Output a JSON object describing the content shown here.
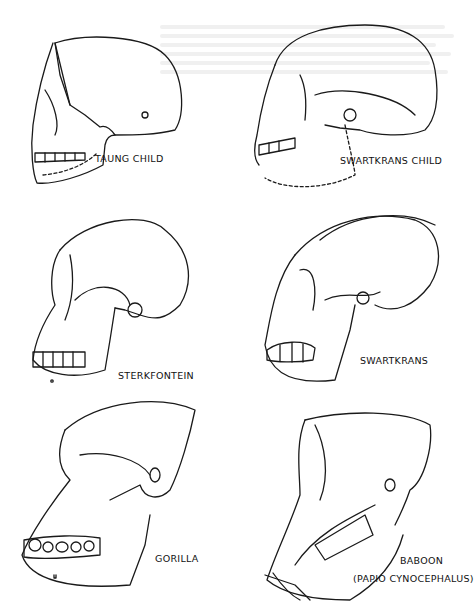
{
  "figures": [
    {
      "id": "taung-child",
      "caption": "TAUNG CHILD"
    },
    {
      "id": "swartkrans-child",
      "caption": "SWARTKRANS CHILD"
    },
    {
      "id": "sterkfontein",
      "caption": "STERKFONTEIN"
    },
    {
      "id": "swartkrans",
      "caption": "SWARTKRANS"
    },
    {
      "id": "gorilla",
      "caption": "GORILLA"
    },
    {
      "id": "baboon",
      "caption": "BABOON",
      "subcaption": "(PAPIO CYNOCEPHALUS)"
    }
  ]
}
